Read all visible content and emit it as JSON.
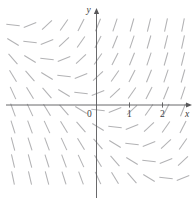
{
  "figure": {
    "kind": "slope-field",
    "width": 195,
    "height": 206,
    "background": "#ffffff"
  },
  "axes": {
    "x_axis_label": "x",
    "y_axis_label": "y",
    "origin_label": "0",
    "x_ticks": [
      {
        "label": "1",
        "value": 1
      },
      {
        "label": "2",
        "value": 2
      }
    ],
    "y_ticks": [],
    "axis_color": "#58585a",
    "label_color": "#3b3b3d",
    "origin_px": {
      "x": 96.5,
      "y": 105.0
    },
    "unit_px": 33.0,
    "x_axis_span_px": {
      "from": 6,
      "to": 188
    },
    "y_axis_span_px": {
      "from": 198,
      "to": 12
    }
  },
  "chart_data": {
    "type": "scatter",
    "title": "",
    "xlabel": "x",
    "ylabel": "y",
    "grid": false,
    "legend": null,
    "xlim": [
      -2.75,
      2.75
    ],
    "ylim": [
      -2.9,
      2.5
    ],
    "slope_color": "#b2b2b4",
    "segment_length_px": 13.5,
    "grid_spacing_px": 17.0,
    "grid_cols_px": [
      13,
      30,
      47,
      64,
      81,
      98,
      115,
      132,
      149,
      166,
      183
    ],
    "grid_rows_px": [
      25,
      42,
      59,
      76,
      93,
      110,
      127,
      144,
      161,
      178
    ],
    "slope_rule": "dy/dx = x + y",
    "zero_slope_line": "y = -x"
  }
}
